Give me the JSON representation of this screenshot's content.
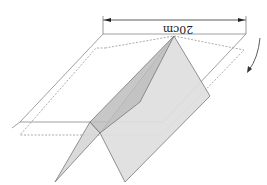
{
  "diagram": {
    "dimension_label": "20cm",
    "orientation": "upside-down",
    "elements": [
      "square-outline-solid",
      "square-outline-dashed",
      "folded-sheet",
      "dimension-line",
      "rotation-arrow"
    ],
    "colors": {
      "fill_light": "#dcdcdc",
      "fill_dark": "#b9b9b9",
      "stroke": "#777777"
    }
  }
}
